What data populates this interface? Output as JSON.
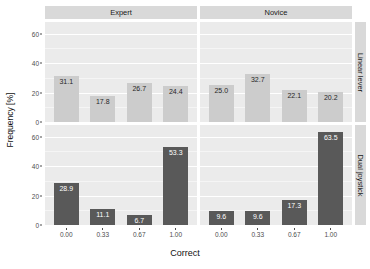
{
  "chart_data": {
    "type": "bar",
    "title": "",
    "xlabel": "Correct",
    "ylabel": "Frequency [%]",
    "categories": [
      "0.00",
      "0.33",
      "0.67",
      "1.00"
    ],
    "ylim": [
      0,
      68
    ],
    "yticks": [
      0,
      20,
      40,
      60
    ],
    "ytick_labels": [
      "0",
      "20",
      "40",
      "60"
    ],
    "grid": true,
    "legend": "none",
    "facet_columns": [
      "Expert",
      "Novice"
    ],
    "facet_rows": [
      "Linear lever",
      "Dual joystick"
    ],
    "colors": {
      "linear_lever_bar": "#cccccc",
      "dual_joystick_bar": "#595959",
      "panel_background": "#ebebeb",
      "strip_background": "#d9d9d9",
      "gridline": "#ffffff"
    },
    "panels": [
      {
        "facet_col": "Expert",
        "facet_row": "Linear lever",
        "fill": "light",
        "values": [
          31.1,
          17.8,
          26.7,
          24.4
        ],
        "labels": [
          "31.1",
          "17.8",
          "26.7",
          "24.4"
        ]
      },
      {
        "facet_col": "Novice",
        "facet_row": "Linear lever",
        "fill": "light",
        "values": [
          25.0,
          32.7,
          22.1,
          20.2
        ],
        "labels": [
          "25.0",
          "32.7",
          "22.1",
          "20.2"
        ]
      },
      {
        "facet_col": "Expert",
        "facet_row": "Dual joystick",
        "fill": "dark",
        "values": [
          28.9,
          11.1,
          6.7,
          53.3
        ],
        "labels": [
          "28.9",
          "11.1",
          "6.7",
          "53.3"
        ]
      },
      {
        "facet_col": "Novice",
        "facet_row": "Dual joystick",
        "fill": "dark",
        "values": [
          9.6,
          9.6,
          17.3,
          63.5
        ],
        "labels": [
          "9.6",
          "9.6",
          "17.3",
          "63.5"
        ]
      }
    ]
  },
  "axes": {
    "y_title": "Frequency [%]",
    "x_title": "Correct",
    "y_ticks": [
      "60",
      "40",
      "20",
      "0"
    ],
    "x_ticks": [
      "0.00",
      "0.33",
      "0.67",
      "1.00"
    ]
  },
  "strips": {
    "top_left": "Expert",
    "top_right": "Novice",
    "right_top": "Linear lever",
    "right_bottom": "Dual joystick"
  }
}
